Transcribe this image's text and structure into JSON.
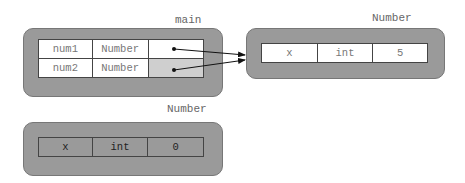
{
  "frames": {
    "main": {
      "label": "main",
      "rows": [
        {
          "name": "num1",
          "type": "Number",
          "value": ""
        },
        {
          "name": "num2",
          "type": "Number",
          "value": ""
        }
      ]
    },
    "number_live": {
      "label": "Number",
      "row": {
        "name": "x",
        "type": "int",
        "value": "5"
      }
    },
    "number_garbage": {
      "label": "Number",
      "row": {
        "name": "x",
        "type": "int",
        "value": "0"
      }
    }
  },
  "colors": {
    "frame_fill": "#9a9a9a",
    "cell_fill": "#ffffff",
    "highlight_cell": "#cfcfcf",
    "garbage_cell": "#9a9a9a",
    "arrow": "#111111"
  }
}
